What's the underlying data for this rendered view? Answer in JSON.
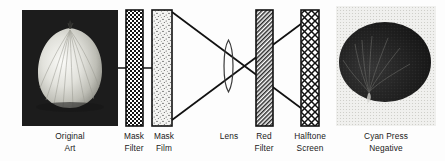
{
  "diagram": {
    "background_color": "#fdfdfd",
    "ink_color": "#1a1a1a",
    "elements": [
      {
        "id": "original-art",
        "kind": "photograph",
        "label_lines": [
          "Original",
          "Art"
        ],
        "subject": "onion",
        "tone": "positive",
        "frame_color": "#1c1c1c",
        "x": 22,
        "y": 10,
        "w": 96,
        "h": 116,
        "label_cx": 70,
        "label_y": 131
      },
      {
        "id": "mask-filter",
        "kind": "plate",
        "label_lines": [
          "Mask",
          "Filter"
        ],
        "pattern": "checkerboard",
        "x": 126,
        "y": 10,
        "w": 17,
        "h": 116,
        "label_cx": 134,
        "label_y": 131
      },
      {
        "id": "mask-film",
        "kind": "plate",
        "label_lines": [
          "Mask",
          "Film"
        ],
        "pattern": "stipple",
        "x": 152,
        "y": 10,
        "w": 20,
        "h": 116,
        "label_cx": 162,
        "label_y": 131
      },
      {
        "id": "lens",
        "kind": "lens",
        "label_lines": [
          "Lens"
        ],
        "pattern": "outline",
        "x": 222,
        "y": 40,
        "w": 13,
        "h": 52,
        "label_cx": 228,
        "label_y": 131
      },
      {
        "id": "red-filter",
        "kind": "plate",
        "label_lines": [
          "Red",
          "Filter"
        ],
        "pattern": "diagonal-hatch",
        "x": 256,
        "y": 10,
        "w": 17,
        "h": 116,
        "label_cx": 264,
        "label_y": 131
      },
      {
        "id": "halftone-screen",
        "kind": "plate",
        "label_lines": [
          "Halftone",
          "Screen"
        ],
        "pattern": "cross-lattice",
        "x": 301,
        "y": 10,
        "w": 18,
        "h": 116,
        "label_cx": 310,
        "label_y": 131
      },
      {
        "id": "cyan-press-negative",
        "kind": "photograph",
        "label_lines": [
          "Cyan Press",
          "Negative"
        ],
        "subject": "onion",
        "tone": "negative-halftone",
        "frame_color": "#e8e8e8",
        "x": 336,
        "y": 6,
        "w": 100,
        "h": 120,
        "label_cx": 386,
        "label_y": 131
      }
    ],
    "rays": {
      "description": "Two straight light rays crossing at the lens center",
      "cross_point": {
        "x": 228.5,
        "y": 66
      },
      "lines": [
        {
          "from": {
            "x": 172,
            "y": 12
          },
          "to": {
            "x": 317,
            "y": 120
          }
        },
        {
          "from": {
            "x": 172,
            "y": 120
          },
          "to": {
            "x": 317,
            "y": 12
          }
        }
      ],
      "connector": {
        "from": {
          "x": 118,
          "y": 68
        },
        "to": {
          "x": 152,
          "y": 68
        }
      }
    },
    "labels": {
      "original_art": [
        "Original",
        "Art"
      ],
      "mask_filter": [
        "Mask",
        "Filter"
      ],
      "mask_film": [
        "Mask",
        "Film"
      ],
      "lens": [
        "Lens"
      ],
      "red_filter": [
        "Red",
        "Filter"
      ],
      "halftone_screen": [
        "Halftone",
        "Screen"
      ],
      "cyan_press_negative": [
        "Cyan Press",
        "Negative"
      ]
    }
  }
}
